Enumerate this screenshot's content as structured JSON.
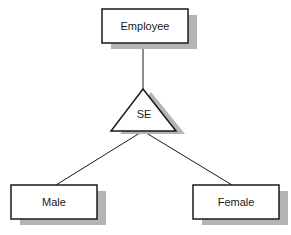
{
  "diagram": {
    "type": "specialization",
    "colors": {
      "stroke": "#1a1a1a",
      "shadow": "#b4b4b4",
      "fill": "#ffffff"
    },
    "superclass": {
      "label": "Employee"
    },
    "specialization": {
      "label": "SE"
    },
    "subclasses": [
      {
        "label": "Male"
      },
      {
        "label": "Female"
      }
    ]
  }
}
